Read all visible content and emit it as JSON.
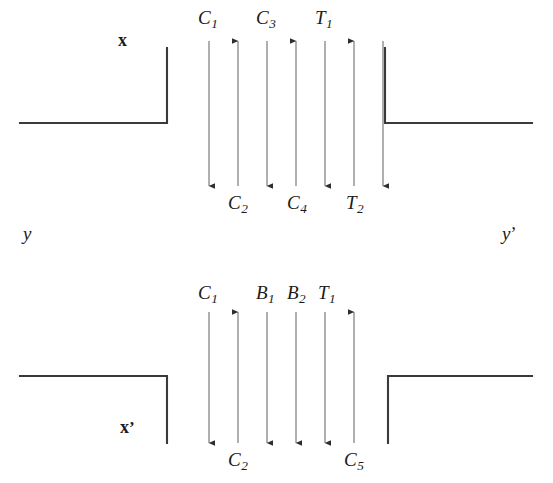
{
  "figure": {
    "background_color": "#ffffff",
    "line_color": "#3a3a3a",
    "text_color": "#1b1b1b"
  },
  "panels": [
    {
      "id": "top-panel",
      "name": "upper-channel",
      "axis_labels": [
        {
          "name": "axis-label-x",
          "text": "x",
          "style": "upright"
        },
        {
          "name": "axis-label-y",
          "text": "y",
          "style": "italic"
        },
        {
          "name": "axis-label-y-prime",
          "base": "y",
          "prime": "’",
          "style": "italic"
        }
      ],
      "walls": [
        {
          "name": "wall-left-upper",
          "shape": "L-corner",
          "orientation": "horizontal-then-up"
        },
        {
          "name": "wall-right-upper",
          "shape": "L-corner",
          "orientation": "up-then-horizontal"
        }
      ],
      "arrows": [
        {
          "index": 1,
          "direction": "down",
          "top_label": "C",
          "top_sub": "1",
          "bottom_label": "",
          "bottom_sub": ""
        },
        {
          "index": 2,
          "direction": "up",
          "top_label": "",
          "top_sub": "",
          "bottom_label": "C",
          "bottom_sub": "2"
        },
        {
          "index": 3,
          "direction": "down",
          "top_label": "C",
          "top_sub": "3",
          "bottom_label": "",
          "bottom_sub": ""
        },
        {
          "index": 4,
          "direction": "up",
          "top_label": "",
          "top_sub": "",
          "bottom_label": "C",
          "bottom_sub": "4"
        },
        {
          "index": 5,
          "direction": "down",
          "top_label": "T",
          "top_sub": "1",
          "bottom_label": "",
          "bottom_sub": ""
        },
        {
          "index": 6,
          "direction": "up",
          "top_label": "",
          "top_sub": "",
          "bottom_label": "T",
          "bottom_sub": "2"
        },
        {
          "index": 7,
          "direction": "down",
          "top_label": "",
          "top_sub": "",
          "bottom_label": "",
          "bottom_sub": ""
        }
      ]
    },
    {
      "id": "bottom-panel",
      "name": "lower-channel",
      "axis_labels": [
        {
          "name": "axis-label-x-prime",
          "base": "x",
          "prime": "’",
          "style": "upright"
        }
      ],
      "walls": [
        {
          "name": "wall-left-lower",
          "shape": "L-corner",
          "orientation": "horizontal-then-down"
        },
        {
          "name": "wall-right-lower",
          "shape": "L-corner",
          "orientation": "down-then-horizontal"
        }
      ],
      "arrows": [
        {
          "index": 1,
          "direction": "down",
          "top_label": "C",
          "top_sub": "1",
          "bottom_label": "",
          "bottom_sub": ""
        },
        {
          "index": 2,
          "direction": "up",
          "top_label": "",
          "top_sub": "",
          "bottom_label": "C",
          "bottom_sub": "2"
        },
        {
          "index": 3,
          "direction": "down",
          "top_label": "B",
          "top_sub": "1",
          "bottom_label": "",
          "bottom_sub": ""
        },
        {
          "index": 4,
          "direction": "down",
          "top_label": "B",
          "top_sub": "2",
          "bottom_label": "",
          "bottom_sub": ""
        },
        {
          "index": 5,
          "direction": "down",
          "top_label": "T",
          "top_sub": "1",
          "bottom_label": "",
          "bottom_sub": ""
        },
        {
          "index": 6,
          "direction": "up",
          "top_label": "",
          "top_sub": "",
          "bottom_label": "C",
          "bottom_sub": "5"
        }
      ]
    }
  ],
  "labels": {
    "top": {
      "C1": "C",
      "C1s": "1",
      "C3": "C",
      "C3s": "3",
      "T1": "T",
      "T1s": "1",
      "C2": "C",
      "C2s": "2",
      "C4": "C",
      "C4s": "4",
      "T2": "T",
      "T2s": "2",
      "x": "x",
      "y": "y",
      "yprime_base": "y",
      "yprime_mark": "’"
    },
    "bottom": {
      "C1": "C",
      "C1s": "1",
      "B1": "B",
      "B1s": "1",
      "B2": "B",
      "B2s": "2",
      "T1": "T",
      "T1s": "1",
      "C2": "C",
      "C2s": "2",
      "C5": "C",
      "C5s": "5",
      "xprime_base": "x",
      "xprime_mark": "’"
    }
  }
}
